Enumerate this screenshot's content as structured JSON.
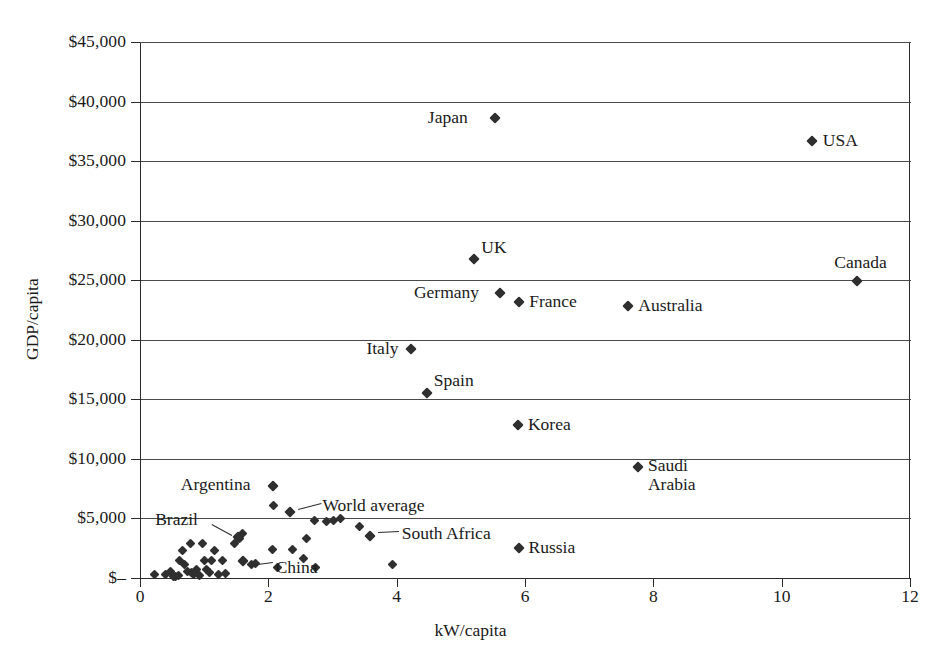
{
  "chart_data": {
    "type": "scatter",
    "title": "",
    "xlabel": "kW/capita",
    "ylabel": "GDP/capita",
    "xlim": [
      0,
      12
    ],
    "ylim": [
      0,
      45000
    ],
    "xticks": [
      "0",
      "2",
      "4",
      "6",
      "8",
      "10",
      "12"
    ],
    "xtick_values": [
      0,
      2,
      4,
      6,
      8,
      10,
      12
    ],
    "yticks": [
      "$–",
      "$5,000",
      "$10,000",
      "$15,000",
      "$20,000",
      "$25,000",
      "$30,000",
      "$35,000",
      "$40,000",
      "$45,000"
    ],
    "ytick_values": [
      0,
      5000,
      10000,
      15000,
      20000,
      25000,
      30000,
      35000,
      40000,
      45000
    ],
    "grid": "horizontal",
    "legend": "none",
    "marker": "diamond",
    "marker_color": "#2f2f2f",
    "axis_color": "#2b2b2b",
    "grid_color": "#4a4a4a",
    "labeled_points": [
      {
        "name": "Japan",
        "x": 5.53,
        "y": 38600,
        "label_side": "left"
      },
      {
        "name": "USA",
        "x": 10.47,
        "y": 36700,
        "label_side": "right"
      },
      {
        "name": "UK",
        "x": 5.21,
        "y": 26800,
        "label_side": "upper-right"
      },
      {
        "name": "Canada",
        "x": 11.17,
        "y": 24900,
        "label_side": "above"
      },
      {
        "name": "Germany",
        "x": 5.61,
        "y": 23950,
        "label_side": "left"
      },
      {
        "name": "France",
        "x": 5.91,
        "y": 23150,
        "label_side": "right"
      },
      {
        "name": "Australia",
        "x": 7.61,
        "y": 22800,
        "label_side": "right"
      },
      {
        "name": "Italy",
        "x": 4.23,
        "y": 19250,
        "label_side": "left"
      },
      {
        "name": "Spain",
        "x": 4.47,
        "y": 15500,
        "label_side": "upper-right"
      },
      {
        "name": "Korea",
        "x": 5.89,
        "y": 12850,
        "label_side": "right"
      },
      {
        "name": "Saudi Arabia",
        "x": 7.76,
        "y": 9300,
        "label_side": "right-two-line"
      },
      {
        "name": "Argentina",
        "x": 2.07,
        "y": 7700,
        "label_side": "left"
      },
      {
        "name": "World average",
        "x": 2.33,
        "y": 5550,
        "label_side": "leader-right"
      },
      {
        "name": "Brazil",
        "x": 1.53,
        "y": 3450,
        "label_side": "leader-right"
      },
      {
        "name": "China",
        "x": 1.6,
        "y": 1450,
        "label_side": "leader-right"
      },
      {
        "name": "South Africa",
        "x": 3.58,
        "y": 3500,
        "label_side": "leader-right"
      },
      {
        "name": "Russia",
        "x": 5.9,
        "y": 2500,
        "label_side": "right"
      }
    ],
    "unlabeled_points": [
      {
        "x": 0.22,
        "y": 300
      },
      {
        "x": 0.4,
        "y": 260
      },
      {
        "x": 0.48,
        "y": 520
      },
      {
        "x": 0.52,
        "y": 160
      },
      {
        "x": 0.56,
        "y": 140
      },
      {
        "x": 0.6,
        "y": 200
      },
      {
        "x": 0.62,
        "y": 1450
      },
      {
        "x": 0.66,
        "y": 2350
      },
      {
        "x": 0.7,
        "y": 1100
      },
      {
        "x": 0.74,
        "y": 560
      },
      {
        "x": 0.78,
        "y": 2900
      },
      {
        "x": 0.8,
        "y": 420
      },
      {
        "x": 0.84,
        "y": 300
      },
      {
        "x": 0.88,
        "y": 680
      },
      {
        "x": 0.92,
        "y": 250
      },
      {
        "x": 0.97,
        "y": 2900
      },
      {
        "x": 1.0,
        "y": 1500
      },
      {
        "x": 1.04,
        "y": 700
      },
      {
        "x": 1.08,
        "y": 420
      },
      {
        "x": 1.12,
        "y": 1450
      },
      {
        "x": 1.16,
        "y": 2350
      },
      {
        "x": 1.22,
        "y": 300
      },
      {
        "x": 1.28,
        "y": 1500
      },
      {
        "x": 1.34,
        "y": 400
      },
      {
        "x": 1.48,
        "y": 2900
      },
      {
        "x": 1.55,
        "y": 3300
      },
      {
        "x": 1.6,
        "y": 3700
      },
      {
        "x": 1.74,
        "y": 1100
      },
      {
        "x": 1.8,
        "y": 1200
      },
      {
        "x": 2.07,
        "y": 2400
      },
      {
        "x": 2.08,
        "y": 6050
      },
      {
        "x": 2.14,
        "y": 900
      },
      {
        "x": 2.38,
        "y": 2400
      },
      {
        "x": 2.55,
        "y": 1650
      },
      {
        "x": 2.6,
        "y": 3300
      },
      {
        "x": 2.72,
        "y": 4800
      },
      {
        "x": 2.74,
        "y": 900
      },
      {
        "x": 2.9,
        "y": 4750
      },
      {
        "x": 3.02,
        "y": 4800
      },
      {
        "x": 3.12,
        "y": 5000
      },
      {
        "x": 3.42,
        "y": 4300
      },
      {
        "x": 3.93,
        "y": 1150
      }
    ]
  }
}
